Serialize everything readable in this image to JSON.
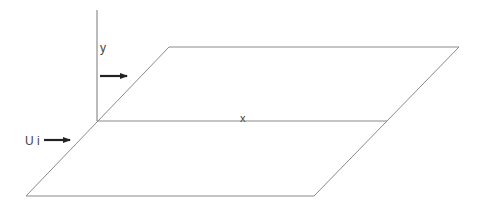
{
  "diagram": {
    "width": 484,
    "height": 209,
    "colors": {
      "line": "#8a8a8a",
      "axis": "#777777",
      "arrow": "#222222",
      "text": "#444444"
    },
    "labels": {
      "y_axis": "y",
      "x_axis": "x",
      "freestream": "U i"
    },
    "plate": {
      "top_left": [
        169,
        47
      ],
      "top_right": [
        459,
        47
      ],
      "bottom_right": [
        314,
        196
      ],
      "bottom_left": [
        26,
        196
      ]
    },
    "midline": {
      "from": [
        97,
        121
      ],
      "to": [
        387,
        121
      ]
    },
    "vertical_axis": {
      "from": [
        97,
        10
      ],
      "to": [
        97,
        121
      ]
    },
    "arrows": [
      {
        "name": "flow-arrow-upper",
        "from": [
          100,
          76
        ],
        "to": [
          127,
          76
        ]
      },
      {
        "name": "flow-arrow-inlet",
        "from": [
          44,
          140
        ],
        "to": [
          70,
          140
        ]
      }
    ]
  }
}
